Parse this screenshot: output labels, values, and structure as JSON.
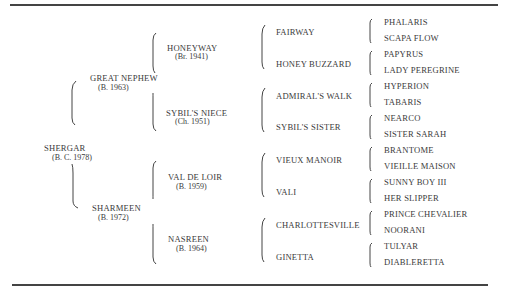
{
  "table": {
    "subject": {
      "name": "SHERGAR",
      "detail": "(B. C. 1978)"
    },
    "parents": [
      {
        "name": "GREAT NEPHEW",
        "detail": "(B. 1963)",
        "role": "sire"
      },
      {
        "name": "SHARMEEN",
        "detail": "(B. 1972)",
        "role": "dam"
      }
    ],
    "grandparents": [
      {
        "name": "HONEYWAY",
        "detail": "(Br. 1941)"
      },
      {
        "name": "SYBIL'S NIECE",
        "detail": "(Ch. 1951)"
      },
      {
        "name": "VAL DE LOIR",
        "detail": "(B. 1959)"
      },
      {
        "name": "NASREEN",
        "detail": "(B. 1964)"
      }
    ],
    "great_grandparents": [
      "FAIRWAY",
      "HONEY BUZZARD",
      "ADMIRAL'S WALK",
      "SYBIL'S SISTER",
      "VIEUX MANOIR",
      "VALI",
      "CHARLOTTESVILLE",
      "GINETTA"
    ],
    "great_great_grandparents": [
      "PHALARIS",
      "SCAPA FLOW",
      "PAPYRUS",
      "LADY PEREGRINE",
      "HYPERION",
      "TABARIS",
      "NEARCO",
      "SISTER SARAH",
      "BRANTOME",
      "VIEILLE MAISON",
      "SUNNY BOY III",
      "HER SLIPPER",
      "PRINCE CHEVALIER",
      "NOORANI",
      "TULYAR",
      "DIABLERETTA"
    ]
  }
}
